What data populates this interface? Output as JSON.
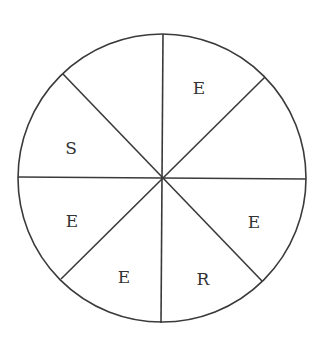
{
  "diagram": {
    "type": "spinner-wheel",
    "sector_count": 8,
    "stroke_color": "#3a3a3a",
    "text_color": "#333333",
    "background": "#ffffff",
    "circle": {
      "cx": 162,
      "cy": 178,
      "r": 144
    },
    "dividers": [
      {
        "x1": 163,
        "y1": 34,
        "x2": 161,
        "y2": 323
      },
      {
        "x1": 18,
        "y1": 177,
        "x2": 306,
        "y2": 179
      },
      {
        "x1": 63,
        "y1": 74,
        "x2": 262,
        "y2": 281
      },
      {
        "x1": 265,
        "y1": 77,
        "x2": 61,
        "y2": 279
      }
    ],
    "sectors": [
      {
        "position": "top-right",
        "label": "E",
        "x": 199,
        "y": 94
      },
      {
        "position": "right-upper",
        "label": "",
        "x": 250,
        "y": 145
      },
      {
        "position": "right-lower",
        "label": "E",
        "x": 254,
        "y": 228
      },
      {
        "position": "bottom-right",
        "label": "R",
        "x": 203,
        "y": 285
      },
      {
        "position": "bottom-left",
        "label": "E",
        "x": 124,
        "y": 283
      },
      {
        "position": "left-lower",
        "label": "E",
        "x": 72,
        "y": 227
      },
      {
        "position": "left-upper",
        "label": "S",
        "x": 71,
        "y": 154
      },
      {
        "position": "top-left",
        "label": "",
        "x": 125,
        "y": 92
      }
    ]
  }
}
